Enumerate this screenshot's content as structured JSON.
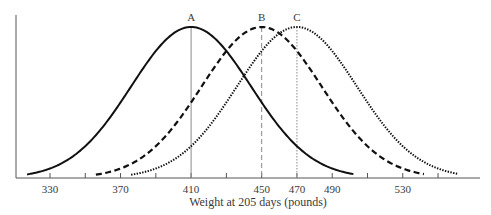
{
  "chart_data": {
    "type": "line",
    "title": "",
    "xlabel": "Weight at 205 days (pounds)",
    "ylabel": "",
    "xlim": [
      316,
      584
    ],
    "x_ticks": [
      330,
      350,
      370,
      390,
      410,
      430,
      450,
      470,
      490,
      510,
      530,
      550
    ],
    "x_tick_labels": [
      "330",
      "",
      "370",
      "",
      "410",
      "",
      "450",
      "470",
      "490",
      "",
      "530",
      ""
    ],
    "grid": false,
    "legend": null,
    "series": [
      {
        "name": "A",
        "distribution": "normal",
        "mean": 410,
        "sd": 34,
        "x_range": [
          317,
          502
        ],
        "line_style": "solid",
        "color": "#111111",
        "mean_line_style": "solid"
      },
      {
        "name": "B",
        "distribution": "normal",
        "mean": 450,
        "sd": 34,
        "x_range": [
          356,
          542
        ],
        "line_style": "dashed",
        "color": "#111111",
        "mean_line_style": "dashed"
      },
      {
        "name": "C",
        "distribution": "normal",
        "mean": 470,
        "sd": 34,
        "x_range": [
          376,
          561
        ],
        "line_style": "dotted",
        "color": "#111111",
        "mean_line_style": "dotted"
      }
    ],
    "annotations": [
      {
        "text": "A",
        "x": 410,
        "position": "above peak"
      },
      {
        "text": "B",
        "x": 450,
        "position": "above peak"
      },
      {
        "text": "C",
        "x": 470,
        "position": "above peak"
      }
    ]
  },
  "colors": {
    "curve": "#111111",
    "axis": "#555555",
    "mean_line": "#8a8a8a",
    "text": "#3a3a3a"
  }
}
